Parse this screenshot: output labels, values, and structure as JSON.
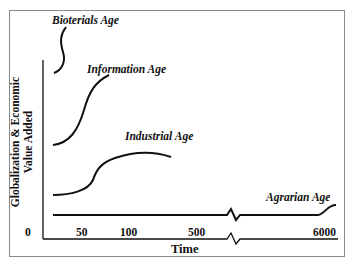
{
  "diagram": {
    "title": "",
    "y_axis_label_line1": "Globalization & Economic",
    "y_axis_label_line2": "Value Added",
    "x_axis_label": "Time",
    "x_ticks": [
      "0",
      "50",
      "100",
      "500",
      "6000"
    ],
    "curves": [
      {
        "name": "Bioterials Age",
        "label": "Bioterials Age"
      },
      {
        "name": "Information Age",
        "label": "Information Age"
      },
      {
        "name": "Industrial Age",
        "label": "Industrial Age"
      },
      {
        "name": "Agrarian Age",
        "label": "Agrarian Age"
      }
    ],
    "colors": {
      "line": "#111111",
      "frame": "#8a8a8a",
      "background": "#ffffff"
    }
  }
}
